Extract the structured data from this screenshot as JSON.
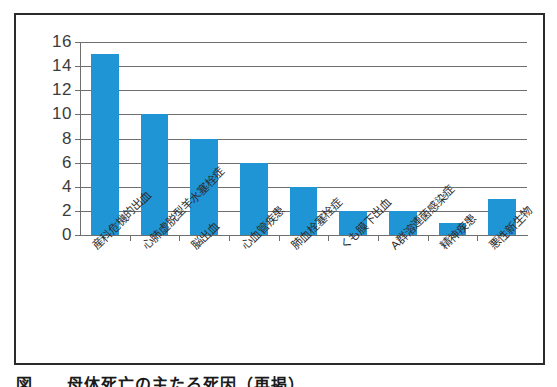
{
  "figure": {
    "caption": "図　　母体死亡の主たる死因（再掲）",
    "frame_color": "#2b2b2b",
    "background_color": "#ffffff"
  },
  "chart_data": {
    "type": "bar",
    "title": "",
    "xlabel": "",
    "ylabel": "",
    "categories": [
      "産科危機的出血",
      "心肺虚脱型羊水塞栓症",
      "脳出血",
      "心血管疾患",
      "肺血栓塞栓症",
      "くも膜下出血",
      "A群溶連菌感染症",
      "精神疾患",
      "悪性新生物"
    ],
    "values": [
      15,
      10,
      8,
      6,
      4,
      2,
      2,
      1,
      3
    ],
    "ylim": [
      0,
      16
    ],
    "yticks": [
      0,
      2,
      4,
      6,
      8,
      10,
      12,
      14,
      16
    ],
    "ytick_labels": [
      "0",
      "2",
      "4",
      "6",
      "8",
      "10",
      "12",
      "14",
      "16"
    ],
    "grid": true,
    "grid_axis": "y",
    "legend": false,
    "legend_position": "none",
    "bar_color": "#1f95d6",
    "axis_color": "#6f6f6f",
    "label_rotation": -45
  }
}
